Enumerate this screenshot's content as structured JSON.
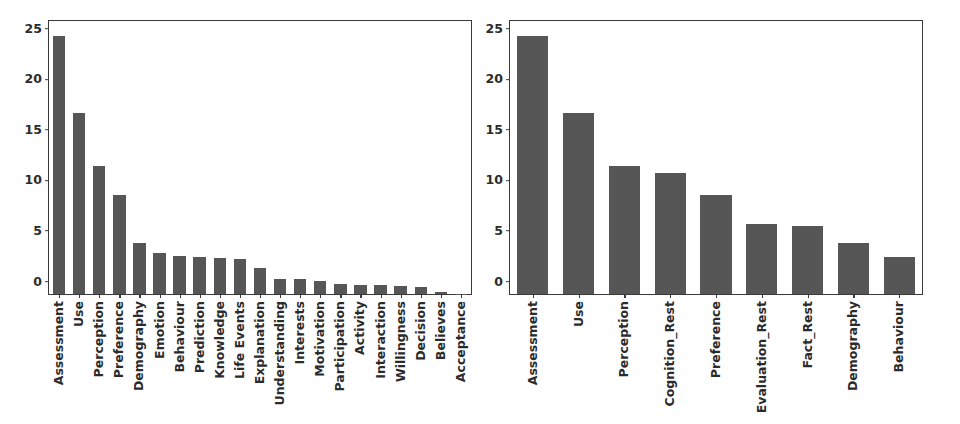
{
  "figure": {
    "background_color": "#ffffff",
    "bar_color": "#565656",
    "axis_color": "#3a3a3a",
    "text_color": "#2b2b2b"
  },
  "chart_data": [
    {
      "type": "bar",
      "panel": "left",
      "title": "",
      "xlabel": "",
      "ylabel": "",
      "ylim": [
        0,
        27
      ],
      "yticks": [
        0,
        5,
        10,
        15,
        20,
        25
      ],
      "ytick_labels": [
        "0",
        "5",
        "10",
        "15",
        "20",
        "25"
      ],
      "grid": false,
      "legend": "none",
      "xtick_rotation": -90,
      "categories": [
        "Assessment",
        "Use",
        "Perception",
        "Preference",
        "Demography",
        "Emotion",
        "Behaviour",
        "Prediction",
        "Knowledge",
        "Life Events",
        "Explanation",
        "Understanding",
        "Interests",
        "Motivation",
        "Participation",
        "Activity",
        "Interaction",
        "Willingness",
        "Decision",
        "Believes",
        "Acceptance"
      ],
      "values": [
        25.5,
        17.9,
        12.7,
        9.8,
        5.0,
        4.1,
        3.8,
        3.7,
        3.6,
        3.5,
        2.6,
        1.5,
        1.45,
        1.3,
        1.0,
        0.9,
        0.85,
        0.75,
        0.7,
        0.2,
        0.05
      ]
    },
    {
      "type": "bar",
      "panel": "right",
      "title": "",
      "xlabel": "",
      "ylabel": "",
      "ylim": [
        0,
        27
      ],
      "yticks": [
        0,
        5,
        10,
        15,
        20,
        25
      ],
      "ytick_labels": [
        "0",
        "5",
        "10",
        "15",
        "20",
        "25"
      ],
      "grid": false,
      "legend": "none",
      "xtick_rotation": -90,
      "categories": [
        "Assessment",
        "Use",
        "Perception",
        "Cognition_Rest",
        "Preference",
        "Evaluation_Rest",
        "Fact_Rest",
        "Demography",
        "Behaviour"
      ],
      "values": [
        25.5,
        17.9,
        12.7,
        12.0,
        9.8,
        6.9,
        6.7,
        5.0,
        3.7
      ]
    }
  ]
}
